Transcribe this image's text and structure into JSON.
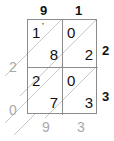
{
  "figure": {
    "type": "lattice-multiplication-grid",
    "rows": 2,
    "columns": 2
  },
  "multiplicand_digits": [
    {
      "value": "9"
    },
    {
      "value": "1"
    }
  ],
  "multiplier_digits": [
    {
      "value": "2"
    },
    {
      "value": "3"
    }
  ],
  "cells": [
    {
      "row": 0,
      "col": 0,
      "tens": "1",
      "units": "8",
      "tick": "’"
    },
    {
      "row": 0,
      "col": 1,
      "tens": "0",
      "units": "2",
      "tick": ""
    },
    {
      "row": 1,
      "col": 0,
      "tens": "2",
      "units": "7",
      "tick": ""
    },
    {
      "row": 1,
      "col": 1,
      "tens": "0",
      "units": "3",
      "tick": ""
    }
  ],
  "result_left": [
    {
      "value": "2"
    },
    {
      "value": "0"
    }
  ],
  "result_bottom": [
    {
      "value": "9"
    },
    {
      "value": "3"
    }
  ],
  "colors": {
    "grid_line": "#8c8c8c",
    "diagonal_line": "#c8c8c8",
    "digit": "#111111",
    "result_digit": "#a9a9a9",
    "background": "#ffffff"
  }
}
